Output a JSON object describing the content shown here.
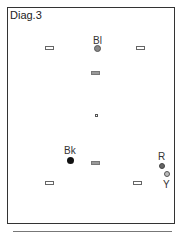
{
  "diagram": {
    "title": "Diag.3",
    "labels": {
      "bl": "Bl",
      "bk": "Bk",
      "r": "R",
      "y": "Y"
    }
  }
}
